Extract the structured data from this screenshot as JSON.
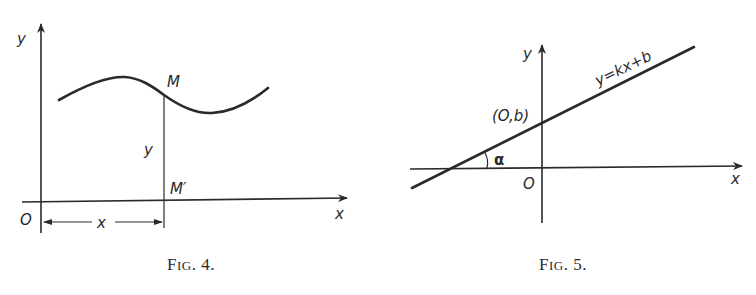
{
  "figures": [
    {
      "id": "fig4",
      "caption": {
        "prefix": "F",
        "small": "IG",
        "suffix": ". 4."
      },
      "labels": {
        "y_axis": "y",
        "x_axis": "x",
        "origin": "O",
        "point_M": "M",
        "point_M_prime": "M′",
        "ordinate": "y",
        "abscissa": "x"
      },
      "description": "Curve with point M; its projection M′ on the x-axis; ordinate y and abscissa x marked"
    },
    {
      "id": "fig5",
      "caption": {
        "prefix": "F",
        "small": "IG",
        "suffix": ". 5."
      },
      "labels": {
        "y_axis": "y",
        "x_axis": "x",
        "origin": "O",
        "intercept": "(O,b)",
        "angle": "α",
        "equation": "y=kx+b"
      },
      "description": "Straight line y=kx+b crossing the y-axis at (0,b), making angle α with the x-axis"
    }
  ]
}
